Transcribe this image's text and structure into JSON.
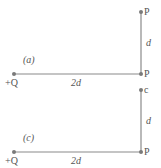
{
  "panels": [
    {
      "tag": "(a)",
      "charge": "+Q",
      "horizontal_length": "2d",
      "vertical_length": "d",
      "top_point": "P",
      "corner_point": "P"
    },
    {
      "tag": "(c)",
      "charge": "+Q",
      "horizontal_length": "2d",
      "vertical_length": "d",
      "top_point": "c",
      "corner_point": "P"
    }
  ],
  "colors": {
    "line": "#8a8a8a",
    "dot": "#7a7a7a",
    "text": "#555555"
  }
}
